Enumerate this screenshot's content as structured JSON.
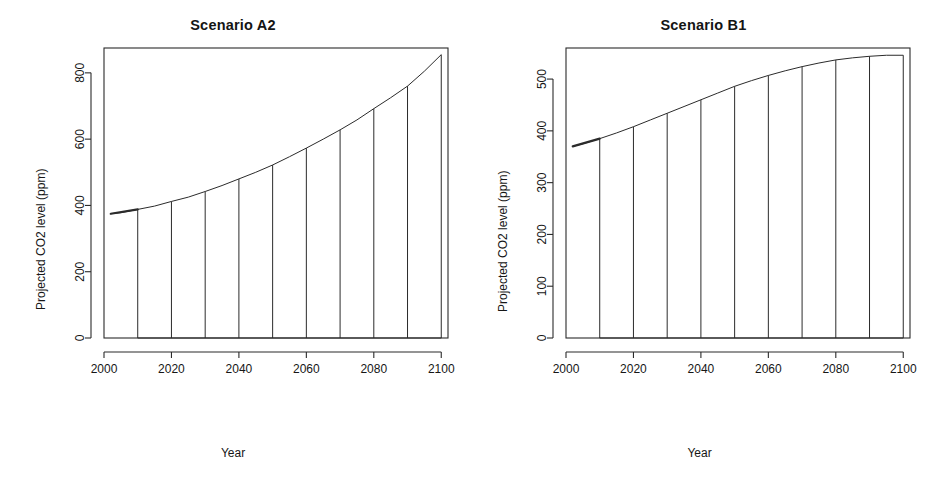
{
  "figure": {
    "background": "#ffffff",
    "line_color": "#2b2b2b",
    "panels": 2
  },
  "panel_a": {
    "title": "Scenario A2",
    "xlabel": "Year",
    "ylabel": "Projected CO2 level (ppm)",
    "x_ticks": [
      "2000",
      "2020",
      "2040",
      "2060",
      "2080",
      "2100"
    ],
    "y_ticks": [
      "0",
      "200",
      "400",
      "600",
      "800"
    ]
  },
  "panel_b": {
    "title": "Scenario B1",
    "xlabel": "Year",
    "ylabel": "Projected CO2 level (ppm)",
    "x_ticks": [
      "2000",
      "2020",
      "2040",
      "2060",
      "2080",
      "2100"
    ],
    "y_ticks": [
      "0",
      "100",
      "200",
      "300",
      "400",
      "500"
    ]
  },
  "chart_data": [
    {
      "type": "area",
      "title": "Scenario A2",
      "xlabel": "Year",
      "ylabel": "Projected CO2 level (ppm)",
      "xlim": [
        2000,
        2102
      ],
      "ylim": [
        0,
        875
      ],
      "grid": false,
      "legend": "none",
      "x_ticks": [
        2000,
        2020,
        2040,
        2060,
        2080,
        2100
      ],
      "y_ticks": [
        0,
        200,
        400,
        600,
        800
      ],
      "curve": {
        "name": "Projected CO2 level (ppm)",
        "x": [
          2002,
          2005,
          2010,
          2015,
          2020,
          2025,
          2030,
          2035,
          2040,
          2045,
          2050,
          2055,
          2060,
          2065,
          2070,
          2075,
          2080,
          2085,
          2090,
          2095,
          2100
        ],
        "y": [
          375,
          378,
          388,
          398,
          412,
          425,
          442,
          460,
          480,
          500,
          522,
          547,
          573,
          600,
          628,
          658,
          692,
          725,
          760,
          805,
          855
        ]
      },
      "drop_lines": {
        "note": "vertical lines dropped from curve to y=0 every 10 years",
        "x": [
          2010,
          2020,
          2030,
          2040,
          2050,
          2060,
          2070,
          2080,
          2090,
          2100
        ],
        "y_top": [
          388,
          412,
          442,
          480,
          522,
          573,
          628,
          692,
          760,
          855
        ],
        "y_bottom": 0
      }
    },
    {
      "type": "area",
      "title": "Scenario B1",
      "xlabel": "Year",
      "ylabel": "Projected CO2 level (ppm)",
      "xlim": [
        2000,
        2102
      ],
      "ylim": [
        0,
        560
      ],
      "grid": false,
      "legend": "none",
      "x_ticks": [
        2000,
        2020,
        2040,
        2060,
        2080,
        2100
      ],
      "y_ticks": [
        0,
        100,
        200,
        300,
        400,
        500
      ],
      "curve": {
        "name": "Projected CO2 level (ppm)",
        "x": [
          2002,
          2005,
          2010,
          2015,
          2020,
          2025,
          2030,
          2035,
          2040,
          2045,
          2050,
          2055,
          2060,
          2065,
          2070,
          2075,
          2080,
          2085,
          2090,
          2095,
          2100
        ],
        "y": [
          370,
          375,
          385,
          396,
          408,
          421,
          434,
          447,
          460,
          473,
          486,
          497,
          507,
          516,
          524,
          531,
          537,
          541,
          544,
          546,
          546
        ]
      },
      "drop_lines": {
        "note": "vertical lines dropped from curve to y=0 every 10 years",
        "x": [
          2010,
          2020,
          2030,
          2040,
          2050,
          2060,
          2070,
          2080,
          2090,
          2100
        ],
        "y_top": [
          385,
          408,
          434,
          460,
          486,
          507,
          524,
          537,
          544,
          546
        ],
        "y_bottom": 0
      }
    }
  ]
}
